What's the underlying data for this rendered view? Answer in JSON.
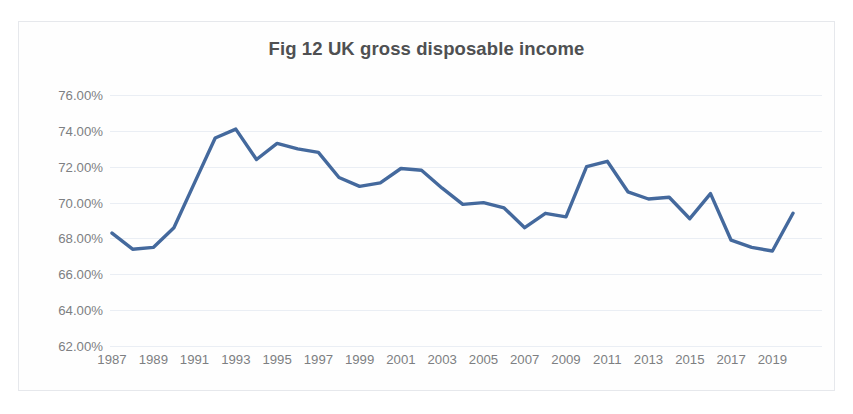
{
  "chart_title": "Fig 12 UK gross disposable income",
  "accent_color": "#44699d",
  "grid_color": "#eaeef4",
  "tick_color": "#7d7f82",
  "title_color": "#4f5052",
  "frame_border_color": "#e6e8ec",
  "y_axis": {
    "ticks": [
      "76.00%",
      "74.00%",
      "72.00%",
      "70.00%",
      "68.00%",
      "66.00%",
      "64.00%",
      "62.00%"
    ]
  },
  "x_axis": {
    "ticks": [
      "1987",
      "1989",
      "1991",
      "1993",
      "1995",
      "1997",
      "1999",
      "2001",
      "2003",
      "2005",
      "2007",
      "2009",
      "2011",
      "2013",
      "2015",
      "2017",
      "2019"
    ]
  },
  "chart_data": {
    "type": "line",
    "title": "Fig 12 UK gross disposable income",
    "subtitle": "",
    "xlabel": "",
    "ylabel": "",
    "grid": true,
    "legend": "none",
    "xlim": [
      1987,
      2020
    ],
    "ylim": [
      62.0,
      76.0
    ],
    "ytick_values": [
      76.0,
      74.0,
      72.0,
      70.0,
      68.0,
      66.0,
      64.0,
      62.0
    ],
    "ytick_labels": [
      "76.00%",
      "74.00%",
      "72.00%",
      "70.00%",
      "68.00%",
      "66.00%",
      "64.00%",
      "62.00%"
    ],
    "xtick_values": [
      1987,
      1989,
      1991,
      1993,
      1995,
      1997,
      1999,
      2001,
      2003,
      2005,
      2007,
      2009,
      2011,
      2013,
      2015,
      2017,
      2019
    ],
    "units": "percent",
    "series": [
      {
        "name": "UK gross disposable income",
        "color": "#44699d",
        "x": [
          1987,
          1988,
          1989,
          1990,
          1991,
          1992,
          1993,
          1994,
          1995,
          1996,
          1997,
          1998,
          1999,
          2000,
          2001,
          2002,
          2003,
          2004,
          2005,
          2006,
          2007,
          2008,
          2009,
          2010,
          2011,
          2012,
          2013,
          2014,
          2015,
          2016,
          2017,
          2018,
          2019,
          2020
        ],
        "values": [
          68.3,
          67.4,
          67.5,
          68.6,
          71.1,
          73.6,
          74.1,
          72.4,
          73.3,
          73.0,
          72.8,
          71.4,
          70.9,
          71.1,
          71.9,
          71.8,
          70.8,
          69.9,
          70.0,
          69.7,
          68.6,
          69.4,
          69.2,
          72.0,
          72.3,
          70.6,
          70.2,
          70.3,
          69.1,
          70.5,
          67.9,
          67.5,
          67.3,
          69.4
        ]
      }
    ]
  }
}
